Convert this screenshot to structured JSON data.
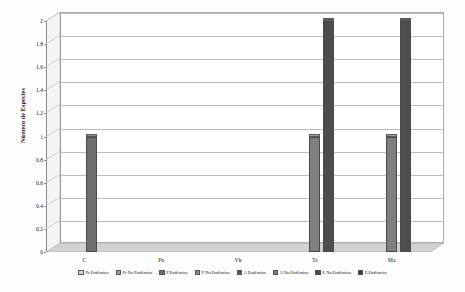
{
  "chart_data": {
    "type": "bar",
    "title": "",
    "xlabel": "",
    "ylabel": "Número de Especies",
    "ylim": [
      0,
      2
    ],
    "ytick_labels": [
      "0",
      "0.2",
      "0.4",
      "0.6",
      "0.8",
      "1",
      "1.2",
      "1.4",
      "1.6",
      "1.8",
      "2"
    ],
    "ytick_values": [
      0,
      0.2,
      0.4,
      0.6,
      0.8,
      1,
      1.2,
      1.4,
      1.6,
      1.8,
      2
    ],
    "grid": true,
    "legend_position": "bottom",
    "style": "3d-column",
    "categories": [
      "C",
      "Px",
      "Vk",
      "Ta",
      "Ma"
    ],
    "series": [
      {
        "name": "Pr Endémica",
        "color": "#d9d9d9",
        "values": [
          0,
          0,
          0,
          0,
          0
        ]
      },
      {
        "name": "Pr No Endémica",
        "color": "#9e9e9e",
        "values": [
          0,
          0,
          0,
          0,
          0
        ]
      },
      {
        "name": "P Endémica",
        "color": "#6e6e6e",
        "values": [
          0,
          0,
          0,
          0,
          0
        ]
      },
      {
        "name": "P No Endémica",
        "color": "#8a8a8a",
        "values": [
          0,
          0,
          0,
          0,
          0
        ]
      },
      {
        "name": "A Endémica",
        "color": "#595959",
        "values": [
          1,
          0,
          0,
          0,
          0
        ]
      },
      {
        "name": "A No Endémica",
        "color": "#7a7a7a",
        "values": [
          0,
          0,
          0,
          1,
          1
        ]
      },
      {
        "name": "E No Endémica",
        "color": "#4a4a4a",
        "values": [
          0,
          0,
          0,
          2,
          2
        ]
      },
      {
        "name": "E Endémica",
        "color": "#3a3a3a",
        "values": [
          0,
          0,
          0,
          0,
          0
        ]
      }
    ],
    "bars": [
      {
        "category": "C",
        "series": "A Endémica",
        "value": 1,
        "color": "#6f6f6f"
      },
      {
        "category": "Ta",
        "series": "A No Endémica",
        "value": 1,
        "color": "#7f7f7f"
      },
      {
        "category": "Ta",
        "series": "E No Endémica",
        "value": 2,
        "color": "#4d4d4d"
      },
      {
        "category": "Ma",
        "series": "A No Endémica",
        "value": 1,
        "color": "#7f7f7f"
      },
      {
        "category": "Ma",
        "series": "E No Endémica",
        "value": 2,
        "color": "#4d4d4d"
      }
    ]
  },
  "axis": {
    "y_title": "Número de Especies"
  },
  "colors": {
    "background": "#fdfdfd",
    "gridline": "#bdbdbd",
    "axis": "#8c8c8c",
    "floor": "#d2d2d2",
    "side_panel": "#f4f4f4",
    "bar_outline": "#4a4a4a"
  }
}
